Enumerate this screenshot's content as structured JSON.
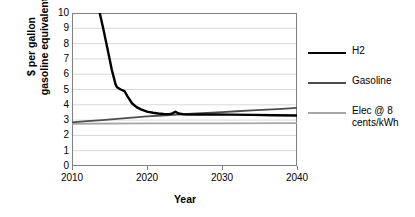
{
  "chart_data": {
    "type": "line",
    "title": "",
    "xlabel": "Year",
    "ylabel": "$ per gallon gasoline equivalent",
    "ylabel_line1": "$ per gallon",
    "ylabel_line2": "gasoline equivalent",
    "xlim": [
      2010,
      2040
    ],
    "ylim": [
      0,
      10
    ],
    "ytick_step": 1,
    "xtick_step": 10,
    "grid": "horizontal",
    "legend_position": "right",
    "yticks": [
      "10",
      "9",
      "8",
      "7",
      "6",
      "5",
      "4",
      "3",
      "2",
      "1",
      "0"
    ],
    "xticks": [
      "2010",
      "2020",
      "2030",
      "2040"
    ],
    "series": [
      {
        "name": "H2",
        "color": "#000000",
        "width": 2.4,
        "x": [
          2013.7,
          2014.2,
          2014.8,
          2015.3,
          2015.8,
          2016.0,
          2016.5,
          2017.0,
          2017.4,
          2018.0,
          2018.6,
          2019.2,
          2020.0,
          2020.8,
          2021.5,
          2022.2,
          2023.0,
          2023.3,
          2023.8,
          2024.2,
          2024.8,
          2025.5,
          2027.0,
          2029.0,
          2031.0,
          2034.0,
          2037.0,
          2040.0
        ],
        "y": [
          10.0,
          8.9,
          7.5,
          6.3,
          5.35,
          5.15,
          5.0,
          4.9,
          4.55,
          4.1,
          3.85,
          3.7,
          3.55,
          3.48,
          3.43,
          3.4,
          3.39,
          3.42,
          3.55,
          3.43,
          3.38,
          3.37,
          3.37,
          3.37,
          3.36,
          3.34,
          3.32,
          3.3
        ]
      },
      {
        "name": "Gasoline",
        "color": "#4d4d4d",
        "width": 1.8,
        "x": [
          2010,
          2012,
          2014,
          2016,
          2018,
          2020,
          2022,
          2024,
          2026,
          2028,
          2030,
          2032,
          2034,
          2036,
          2038,
          2040
        ],
        "y": [
          2.85,
          2.93,
          3.0,
          3.08,
          3.16,
          3.24,
          3.3,
          3.36,
          3.42,
          3.47,
          3.52,
          3.58,
          3.63,
          3.69,
          3.74,
          3.8
        ]
      },
      {
        "name": "Elec @ 8 cents/kWh",
        "label_line1": "Elec @ 8",
        "label_line2": "cents/kWh",
        "color": "#a6a6a6",
        "width": 1.8,
        "x": [
          2010,
          2020,
          2030,
          2040
        ],
        "y": [
          2.76,
          2.78,
          2.79,
          2.8
        ]
      }
    ],
    "gridline_color": "#d9d9d9",
    "axis_color": "#808080",
    "annotations": []
  }
}
